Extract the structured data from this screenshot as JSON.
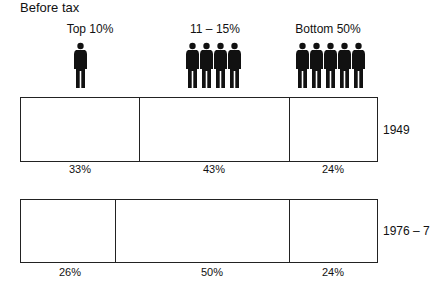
{
  "title": "Before tax",
  "groups": [
    {
      "label": "Top 10%",
      "icons": 1
    },
    {
      "label": "11 – 15%",
      "icons": 4
    },
    {
      "label": "Bottom 50%",
      "icons": 5
    }
  ],
  "rows": [
    {
      "year": "1949",
      "shares": [
        "33%",
        "43%",
        "24%"
      ]
    },
    {
      "year": "1976 – 7",
      "shares": [
        "26%",
        "50%",
        "24%"
      ]
    }
  ],
  "chart_data": {
    "type": "bar",
    "subtype": "stacked-horizontal-100",
    "title": "Before tax",
    "categories": [
      "1949",
      "1976 – 7"
    ],
    "series": [
      {
        "name": "Top 10%",
        "values": [
          33,
          26
        ]
      },
      {
        "name": "11 – 15%",
        "values": [
          43,
          50
        ]
      },
      {
        "name": "Bottom 50%",
        "values": [
          24,
          24
        ]
      }
    ],
    "xlabel": "",
    "ylabel": "",
    "grid": false,
    "legend_position": "top (pictogram)"
  }
}
